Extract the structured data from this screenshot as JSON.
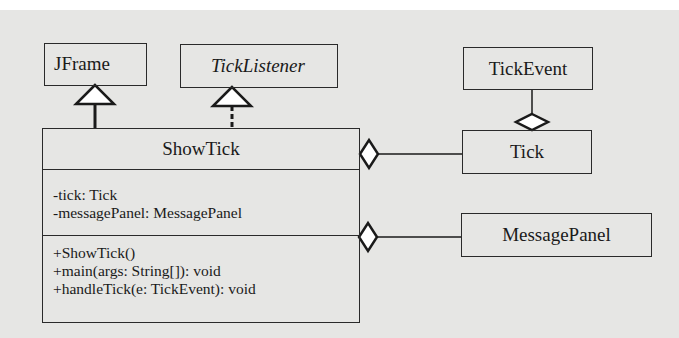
{
  "diagram": {
    "type": "uml-class-diagram",
    "classes": {
      "jframe": {
        "name": "JFrame",
        "italic": false
      },
      "ticklistener": {
        "name": "TickListener",
        "italic": true
      },
      "tickevent": {
        "name": "TickEvent",
        "italic": false
      },
      "tick": {
        "name": "Tick",
        "italic": false
      },
      "messagepanel": {
        "name": "MessagePanel",
        "italic": false
      },
      "showtick": {
        "name": "ShowTick",
        "attributes": [
          "-tick: Tick",
          "-messagePanel: MessagePanel"
        ],
        "methods": [
          "+ShowTick()",
          "+main(args: String[]): void",
          "+handleTick(e: TickEvent): void"
        ]
      }
    },
    "relationships": [
      {
        "from": "ShowTick",
        "to": "JFrame",
        "type": "generalization"
      },
      {
        "from": "ShowTick",
        "to": "TickListener",
        "type": "realization"
      },
      {
        "from": "ShowTick",
        "to": "Tick",
        "type": "aggregation"
      },
      {
        "from": "ShowTick",
        "to": "MessagePanel",
        "type": "aggregation"
      },
      {
        "from": "Tick",
        "to": "TickEvent",
        "type": "aggregation"
      }
    ]
  }
}
